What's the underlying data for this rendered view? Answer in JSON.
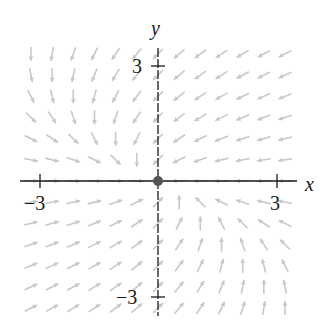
{
  "figure": {
    "type": "vector_field",
    "field": {
      "dx": "-x - y",
      "dy": "-y"
    },
    "axes": {
      "x_label": "x",
      "y_label": "y",
      "x_range": [
        -3.6,
        3.6
      ],
      "y_range": [
        -3.6,
        3.6
      ],
      "x_ticks": [
        {
          "value": -3,
          "label": "−3"
        },
        {
          "value": 3,
          "label": "3"
        }
      ],
      "y_ticks": [
        {
          "value": 3,
          "label": "3"
        },
        {
          "value": -3,
          "label": "−3"
        }
      ]
    },
    "equilibrium_point": {
      "x": 0,
      "y": 0,
      "color": "#555555"
    },
    "grid": {
      "spacing": 0.55,
      "extent": 3.3
    },
    "colors": {
      "axis": "#1a1a1a",
      "arrow": "#c8c8c8",
      "point": "#555555"
    }
  }
}
